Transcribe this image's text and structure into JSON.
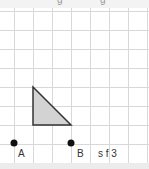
{
  "header": {
    "partial_text_1": "g",
    "partial_text_2": "g"
  },
  "grid": {
    "spacing": 19,
    "line_color": "#d8d8d8"
  },
  "shape": {
    "type": "right-triangle",
    "fill": "#d3d3d3",
    "stroke": "#333333",
    "vertices": [
      [
        33,
        87
      ],
      [
        33,
        125
      ],
      [
        71,
        125
      ]
    ]
  },
  "points": [
    {
      "label": "A",
      "x": 14,
      "y": 143
    },
    {
      "label": "B",
      "x": 71,
      "y": 143
    }
  ],
  "caption": "s f 3"
}
